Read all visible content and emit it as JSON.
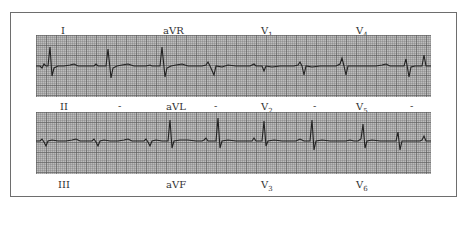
{
  "figure": {
    "strips": [
      {
        "top_labels": [
          {
            "lead": "I",
            "x": 62
          },
          {
            "lead": "aVR",
            "x": 163
          },
          {
            "lead": "V",
            "sub": "1",
            "x": 261
          },
          {
            "lead": "V",
            "sub": "4",
            "x": 356
          }
        ]
      },
      {
        "top_labels": [
          {
            "lead": "II",
            "x": 62
          },
          {
            "lead": "aVL",
            "x": 166
          },
          {
            "lead": "V",
            "sub": "2",
            "x": 261
          },
          {
            "lead": "V",
            "sub": "5",
            "x": 356
          }
        ],
        "separators": [
          "-",
          "-",
          "-",
          "-"
        ]
      }
    ],
    "bottom_labels": [
      {
        "lead": "III",
        "x": 58
      },
      {
        "lead": "aVF",
        "x": 166
      },
      {
        "lead": "V",
        "sub": "3",
        "x": 261
      },
      {
        "lead": "V",
        "sub": "6",
        "x": 356
      }
    ],
    "colors": {
      "grid_bg": "#bdbdbd",
      "trace": "#222222",
      "frame": "#6e6e6e"
    }
  }
}
